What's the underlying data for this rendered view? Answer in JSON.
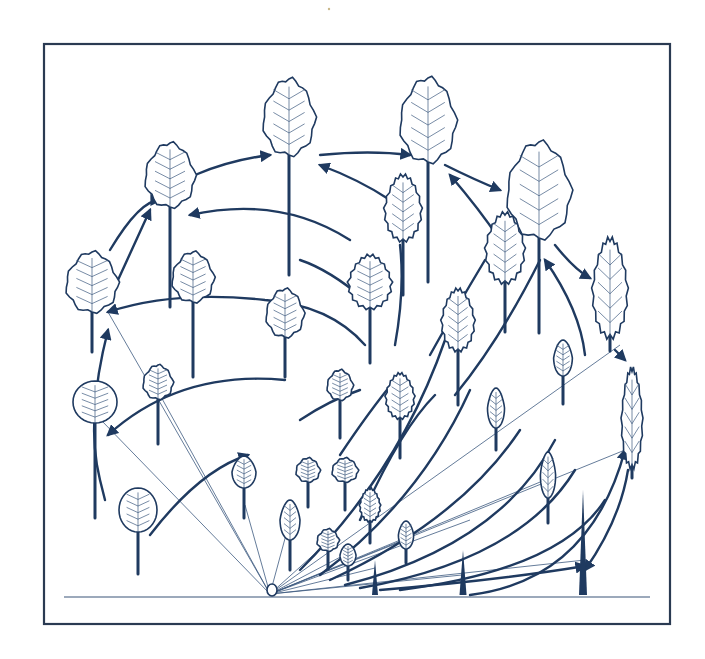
{
  "figure": {
    "colors": {
      "ink": "#1f3a60",
      "frame": "#2a3a52",
      "background": "#ffffff"
    },
    "frame": {
      "x": 44,
      "y": 44,
      "width": 626,
      "height": 580
    },
    "ground_line": {
      "x1": 64,
      "x2": 650,
      "y": 597
    },
    "origin": {
      "x": 270,
      "y": 594
    },
    "rays": [
      [
        108,
        312
      ],
      [
        101,
        420
      ],
      [
        160,
        395
      ],
      [
        245,
        505
      ],
      [
        290,
        520
      ],
      [
        330,
        540
      ],
      [
        348,
        553
      ],
      [
        405,
        540
      ],
      [
        470,
        520
      ],
      [
        545,
        480
      ],
      [
        620,
        345
      ],
      [
        625,
        450
      ],
      [
        585,
        560
      ],
      [
        375,
        568
      ],
      [
        462,
        575
      ]
    ],
    "arcs": [
      {
        "d": "M150 535 Q200 470 248 455",
        "arrow": "end"
      },
      {
        "d": "M105 500 L100 480 Q85 420 108 330",
        "arrow": "end"
      },
      {
        "d": "M108 435 Q180 370 285 380",
        "arrow": "start"
      },
      {
        "d": "M108 312 Q175 290 265 300 Q330 305 365 345",
        "arrow": "start"
      },
      {
        "d": "M110 250 Q140 200 160 200",
        "arrow": "end"
      },
      {
        "d": "M118 280 L150 210",
        "arrow": "end"
      },
      {
        "d": "M190 215 Q280 195 350 240",
        "arrow": "start"
      },
      {
        "d": "M195 175 Q230 160 270 155",
        "arrow": "end"
      },
      {
        "d": "M320 155 Q370 150 410 155",
        "arrow": "end"
      },
      {
        "d": "M320 165 Q360 180 390 200",
        "arrow": "start"
      },
      {
        "d": "M445 165 Q475 180 500 190",
        "arrow": "end"
      },
      {
        "d": "M450 175 Q480 210 500 240",
        "arrow": "start"
      },
      {
        "d": "M555 245 Q575 270 590 278",
        "arrow": "end"
      },
      {
        "d": "M545 260 Q580 310 585 355",
        "arrow": "start"
      },
      {
        "d": "M615 350 L625 360",
        "arrow": "end"
      },
      {
        "d": "M628 470 Q620 520 585 570",
        "arrow": "end"
      },
      {
        "d": "M300 420 Q330 400 360 390",
        "arrow": "none"
      },
      {
        "d": "M340 455 Q370 410 395 380",
        "arrow": "none"
      },
      {
        "d": "M360 520 Q400 430 435 395",
        "arrow": "none"
      },
      {
        "d": "M300 570 Q400 470 445 340",
        "arrow": "none"
      },
      {
        "d": "M320 575 Q420 500 470 390",
        "arrow": "none"
      },
      {
        "d": "M330 580 Q460 520 520 430",
        "arrow": "none"
      },
      {
        "d": "M345 585 Q500 545 555 440",
        "arrow": "none"
      },
      {
        "d": "M360 588 Q520 560 575 470",
        "arrow": "none"
      },
      {
        "d": "M400 590 Q560 570 605 500",
        "arrow": "none"
      },
      {
        "d": "M470 595 Q590 580 625 450",
        "arrow": "end"
      },
      {
        "d": "M380 590 Q500 580 585 566",
        "arrow": "end"
      },
      {
        "d": "M430 355 Q455 310 485 260",
        "arrow": "none"
      },
      {
        "d": "M455 395 Q500 340 540 260",
        "arrow": "none"
      },
      {
        "d": "M395 345 Q405 290 400 245",
        "arrow": "none"
      },
      {
        "d": "M365 300 Q330 270 300 260",
        "arrow": "none"
      }
    ],
    "leaves": [
      {
        "id": "L01",
        "cx": 138,
        "cy": 510,
        "rx": 19,
        "ry": 22,
        "stalk": 42,
        "shape": "round"
      },
      {
        "id": "L02",
        "cx": 95,
        "cy": 402,
        "rx": 22,
        "ry": 21,
        "stalk": 95,
        "shape": "round"
      },
      {
        "id": "L03",
        "cx": 158,
        "cy": 382,
        "rx": 15,
        "ry": 17,
        "stalk": 45,
        "shape": "lobed"
      },
      {
        "id": "L04",
        "cx": 92,
        "cy": 282,
        "rx": 26,
        "ry": 30,
        "stalk": 40,
        "shape": "lobed"
      },
      {
        "id": "L05",
        "cx": 170,
        "cy": 175,
        "rx": 25,
        "ry": 32,
        "stalk": 100,
        "shape": "lobed"
      },
      {
        "id": "L06",
        "cx": 193,
        "cy": 277,
        "rx": 21,
        "ry": 25,
        "stalk": 75,
        "shape": "lobed"
      },
      {
        "id": "L07",
        "cx": 289,
        "cy": 117,
        "rx": 26,
        "ry": 38,
        "stalk": 120,
        "shape": "lobed"
      },
      {
        "id": "L08",
        "cx": 285,
        "cy": 313,
        "rx": 19,
        "ry": 24,
        "stalk": 40,
        "shape": "lobed"
      },
      {
        "id": "L09",
        "cx": 244,
        "cy": 472,
        "rx": 12,
        "ry": 16,
        "stalk": 30,
        "shape": "oval"
      },
      {
        "id": "L10",
        "cx": 290,
        "cy": 520,
        "rx": 10,
        "ry": 20,
        "stalk": 30,
        "shape": "oval"
      },
      {
        "id": "L11",
        "cx": 308,
        "cy": 470,
        "rx": 12,
        "ry": 12,
        "stalk": 25,
        "shape": "lobed"
      },
      {
        "id": "L12",
        "cx": 345,
        "cy": 470,
        "rx": 13,
        "ry": 12,
        "stalk": 28,
        "shape": "lobed"
      },
      {
        "id": "L13",
        "cx": 340,
        "cy": 385,
        "rx": 13,
        "ry": 15,
        "stalk": 38,
        "shape": "lobed"
      },
      {
        "id": "L14",
        "cx": 370,
        "cy": 282,
        "rx": 21,
        "ry": 26,
        "stalk": 55,
        "shape": "serrate"
      },
      {
        "id": "L15",
        "cx": 370,
        "cy": 505,
        "rx": 10,
        "ry": 16,
        "stalk": 22,
        "shape": "serrate"
      },
      {
        "id": "L16",
        "cx": 328,
        "cy": 540,
        "rx": 11,
        "ry": 11,
        "stalk": 18,
        "shape": "lobed"
      },
      {
        "id": "L17",
        "cx": 348,
        "cy": 555,
        "rx": 8,
        "ry": 11,
        "stalk": 14,
        "shape": "oval"
      },
      {
        "id": "L18",
        "cx": 400,
        "cy": 396,
        "rx": 14,
        "ry": 22,
        "stalk": 40,
        "shape": "serrate"
      },
      {
        "id": "L19",
        "cx": 403,
        "cy": 208,
        "rx": 18,
        "ry": 32,
        "stalk": 55,
        "shape": "serrate"
      },
      {
        "id": "L20",
        "cx": 428,
        "cy": 120,
        "rx": 28,
        "ry": 42,
        "stalk": 120,
        "shape": "lobed"
      },
      {
        "id": "L21",
        "cx": 458,
        "cy": 320,
        "rx": 16,
        "ry": 30,
        "stalk": 55,
        "shape": "serrate"
      },
      {
        "id": "L22",
        "cx": 505,
        "cy": 248,
        "rx": 19,
        "ry": 34,
        "stalk": 50,
        "shape": "serrate"
      },
      {
        "id": "L23",
        "cx": 496,
        "cy": 408,
        "rx": 10,
        "ry": 20,
        "stalk": 22,
        "shape": "narrow"
      },
      {
        "id": "L24",
        "cx": 406,
        "cy": 535,
        "rx": 9,
        "ry": 14,
        "stalk": 14,
        "shape": "narrow"
      },
      {
        "id": "L25",
        "cx": 539,
        "cy": 190,
        "rx": 32,
        "ry": 48,
        "stalk": 95,
        "shape": "lobed"
      },
      {
        "id": "L26",
        "cx": 563,
        "cy": 358,
        "rx": 11,
        "ry": 18,
        "stalk": 28,
        "shape": "narrow"
      },
      {
        "id": "L27",
        "cx": 548,
        "cy": 475,
        "rx": 9,
        "ry": 23,
        "stalk": 25,
        "shape": "narrow"
      },
      {
        "id": "L28",
        "cx": 610,
        "cy": 288,
        "rx": 20,
        "ry": 48,
        "stalk": 15,
        "shape": "lanceolate"
      },
      {
        "id": "L29",
        "cx": 632,
        "cy": 418,
        "rx": 12,
        "ry": 48,
        "stalk": 12,
        "shape": "lanceolate"
      }
    ],
    "spikes": [
      {
        "x": 375,
        "base": 595,
        "h": 35,
        "w": 6
      },
      {
        "x": 463,
        "base": 595,
        "h": 45,
        "w": 7
      },
      {
        "x": 583,
        "base": 595,
        "h": 105,
        "w": 8
      }
    ],
    "caption_fragment": ""
  }
}
